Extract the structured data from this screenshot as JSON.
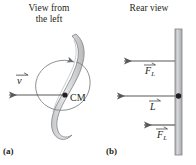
{
  "figure": {
    "width": 196,
    "height": 165,
    "background": "#ffffff",
    "ink_color": "#231f20",
    "body_fill": "#d9d9d9",
    "body_stroke": "#6d6e71",
    "bar_fill": "#bcbec0"
  },
  "panels": {
    "left": {
      "id": "(a)",
      "title": "View from\nthe left",
      "center_of_mass_label": "CM",
      "velocity_vector": {
        "symbol": "v",
        "accent": "vector-arrow",
        "direction": "left"
      },
      "spin_arrow": {
        "name": "rotation-arrow",
        "direction": "counterclockwise-loop"
      }
    },
    "right": {
      "id": "(b)",
      "title": "Rear view",
      "pivot_point_label": "",
      "vectors": [
        {
          "symbol": "F",
          "subscript": "L",
          "accent": "vector-arrow",
          "direction": "left",
          "position": "top"
        },
        {
          "symbol": "L",
          "subscript": "",
          "accent": "vector-arrow",
          "direction": "left",
          "position": "middle"
        },
        {
          "symbol": "F",
          "subscript": "L",
          "accent": "vector-arrow",
          "direction": "left",
          "position": "bottom"
        }
      ]
    }
  }
}
